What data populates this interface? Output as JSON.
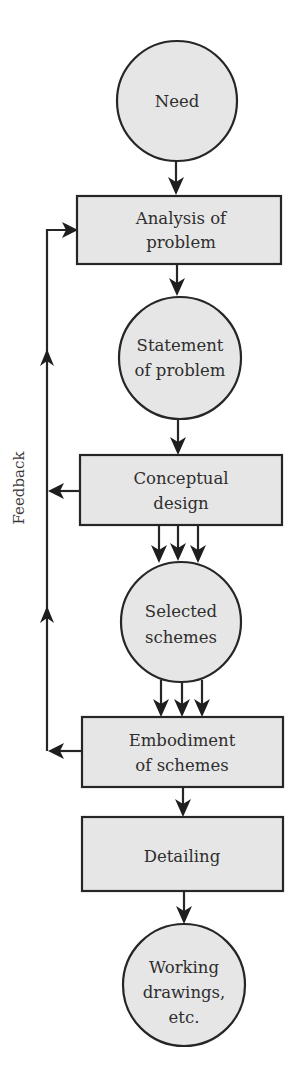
{
  "diagram": {
    "type": "flowchart",
    "colors": {
      "node_fill": "#e6e6e6",
      "stroke": "#262626",
      "text": "#2e2e2e",
      "background": "#ffffff"
    },
    "nodes": [
      {
        "id": "need",
        "shape": "circle",
        "lines": [
          "Need"
        ]
      },
      {
        "id": "analysis",
        "shape": "rect",
        "lines": [
          "Analysis of",
          "problem"
        ]
      },
      {
        "id": "statement",
        "shape": "circle",
        "lines": [
          "Statement",
          "of problem"
        ]
      },
      {
        "id": "conceptual",
        "shape": "rect",
        "lines": [
          "Conceptual",
          "design"
        ]
      },
      {
        "id": "selected",
        "shape": "circle",
        "lines": [
          "Selected",
          "schemes"
        ]
      },
      {
        "id": "embodiment",
        "shape": "rect",
        "lines": [
          "Embodiment",
          "of schemes"
        ]
      },
      {
        "id": "detailing",
        "shape": "rect",
        "lines": [
          "Detailing"
        ]
      },
      {
        "id": "working",
        "shape": "circle",
        "lines": [
          "Working",
          "drawings,",
          "etc."
        ]
      }
    ],
    "edges": [
      {
        "from": "need",
        "to": "analysis",
        "count": 1
      },
      {
        "from": "analysis",
        "to": "statement",
        "count": 1
      },
      {
        "from": "statement",
        "to": "conceptual",
        "count": 1
      },
      {
        "from": "conceptual",
        "to": "selected",
        "count": 3
      },
      {
        "from": "selected",
        "to": "embodiment",
        "count": 3
      },
      {
        "from": "embodiment",
        "to": "detailing",
        "count": 1
      },
      {
        "from": "detailing",
        "to": "working",
        "count": 1
      },
      {
        "from": "conceptual",
        "to": "analysis",
        "type": "feedback"
      },
      {
        "from": "embodiment",
        "to": "analysis",
        "type": "feedback"
      }
    ],
    "feedback_label": "Feedback"
  }
}
